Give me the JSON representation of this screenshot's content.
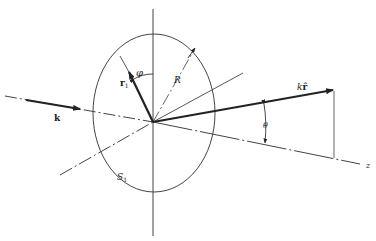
{
  "diagram": {
    "labels": {
      "incident_vector": "k",
      "position_vector": "r",
      "position_subscript": "1",
      "azimuth_angle": "φ",
      "radius": "R",
      "scattered_vector": "k",
      "scattered_hat": "r̂",
      "polar_angle": "θ",
      "aperture": "S",
      "aperture_subscript": "1",
      "axis": "z"
    },
    "colors": {
      "line": "#333333",
      "background": "#ffffff"
    }
  }
}
